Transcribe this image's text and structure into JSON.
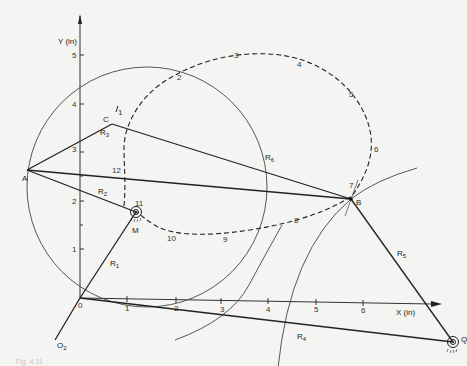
{
  "figure": {
    "caption_faint": "Fig. 4.11",
    "axes": {
      "x_label": "X (in)",
      "y_label": "Y (in)",
      "x_ticks": [
        "1",
        "2",
        "3",
        "4",
        "5",
        "6"
      ],
      "y_ticks": [
        "1",
        "2",
        "3",
        "4",
        "5"
      ],
      "origin_label": "0"
    },
    "points": {
      "A": "A",
      "B": "B",
      "C": "C",
      "M": "M",
      "O2": "O",
      "O2_sub": "2",
      "Q": "Q"
    },
    "links": [
      {
        "name": "R",
        "sub": "1"
      },
      {
        "name": "R",
        "sub": "2"
      },
      {
        "name": "R",
        "sub": "3"
      },
      {
        "name": "R",
        "sub": "4"
      },
      {
        "name": "R",
        "sub": "5"
      },
      {
        "name": "R",
        "sub": "6"
      }
    ],
    "coupler_positions": [
      "1",
      "2",
      "3",
      "4",
      "5",
      "6",
      "7",
      "8",
      "9",
      "10",
      "11",
      "12"
    ],
    "colors": {
      "line": "#2a2a2a",
      "background": "#f4f4f2"
    }
  }
}
